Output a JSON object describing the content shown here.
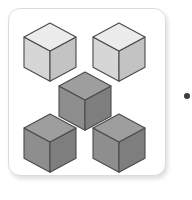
{
  "figure": {
    "background_color": "#ffffff"
  },
  "card": {
    "name": "cube-illustration-card",
    "x": 8,
    "y": 8,
    "width": 158,
    "height": 168,
    "fill": "#ffffff",
    "border_color": "#dcdcdc",
    "border_radius": 12,
    "shadow_color": "rgba(0,0,0,0.13)"
  },
  "palette": {
    "light_top": "#ececec",
    "light_left": "#d6d6d6",
    "light_right": "#c3c3c3",
    "dark_top": "#9e9e9e",
    "dark_left": "#8e8e8e",
    "dark_right": "#7e7e7e",
    "outline": "#4a4a4a",
    "dot": "#3c3c3c"
  },
  "cubes": [
    {
      "name": "cube-top-left",
      "position": "top-left",
      "shade": "light",
      "x": 23,
      "y": 22,
      "size": 52,
      "top_color": "#ececec",
      "left_color": "#d6d6d6",
      "right_color": "#c3c3c3",
      "outline_color": "#4a4a4a"
    },
    {
      "name": "cube-top-right",
      "position": "top-right",
      "shade": "light",
      "x": 92,
      "y": 22,
      "size": 52,
      "top_color": "#ececec",
      "left_color": "#d6d6d6",
      "right_color": "#c3c3c3",
      "outline_color": "#4a4a4a"
    },
    {
      "name": "cube-center",
      "position": "center",
      "shade": "dark",
      "x": 58,
      "y": 71,
      "size": 52,
      "top_color": "#9e9e9e",
      "left_color": "#8e8e8e",
      "right_color": "#7e7e7e",
      "outline_color": "#4a4a4a"
    },
    {
      "name": "cube-bottom-left",
      "position": "bottom-left",
      "shade": "dark",
      "x": 23,
      "y": 113,
      "size": 52,
      "top_color": "#9e9e9e",
      "left_color": "#8e8e8e",
      "right_color": "#7e7e7e",
      "outline_color": "#4a4a4a"
    },
    {
      "name": "cube-bottom-right",
      "position": "bottom-right",
      "shade": "dark",
      "x": 92,
      "y": 113,
      "size": 52,
      "top_color": "#9e9e9e",
      "left_color": "#8e8e8e",
      "right_color": "#7e7e7e",
      "outline_color": "#4a4a4a"
    }
  ],
  "bullet": {
    "name": "bullet-dot",
    "x": 184,
    "y": 93,
    "size": 6,
    "color": "#3c3c3c",
    "clipped": "right-edge"
  }
}
